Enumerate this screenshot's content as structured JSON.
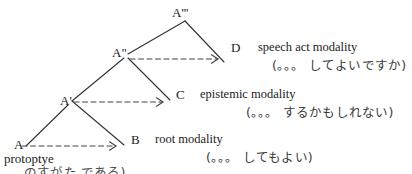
{
  "diagram": {
    "title_text": "",
    "colors": {
      "background": "#ffffff",
      "line": "#333333",
      "dashed_arrow": "#444444",
      "text": "#222222",
      "japanese_text": "#3a3a3a"
    },
    "nodes": [
      {
        "id": "A",
        "label": "A",
        "x": 14,
        "y": 138
      },
      {
        "id": "Ap",
        "label": "A'",
        "x": 60,
        "y": 94
      },
      {
        "id": "App",
        "label": "A\"",
        "x": 112,
        "y": 46
      },
      {
        "id": "Appp",
        "label": "A'''",
        "x": 172,
        "y": 6
      }
    ],
    "terminals": [
      {
        "id": "B",
        "label": "B",
        "gloss": "root modality",
        "japanese": "(。。。 してもよい)",
        "label_x": 131,
        "label_y": 133,
        "gloss_x": 155,
        "gloss_y": 133,
        "jp_x": 206,
        "jp_y": 152
      },
      {
        "id": "C",
        "label": "C",
        "gloss": "epistemic modality",
        "japanese": "(。。。 するかもしれない)",
        "label_x": 176,
        "label_y": 88,
        "gloss_x": 200,
        "gloss_y": 88,
        "jp_x": 246,
        "jp_y": 107
      },
      {
        "id": "D",
        "label": "D",
        "gloss": "speech act modality",
        "japanese": "(。。。 してよいですか)",
        "label_x": 231,
        "label_y": 41,
        "gloss_x": 258,
        "gloss_y": 41,
        "jp_x": 272,
        "jp_y": 60
      }
    ],
    "footer": {
      "prototype_label": "protoptye",
      "prototype_x": 4,
      "prototype_y": 152,
      "clipped_line": "のすがた   である)",
      "clipped_x": 24,
      "clipped_y": 167
    },
    "edges": {
      "spine": [
        {
          "from": "A",
          "to": "Ap",
          "x1": 26,
          "y1": 146,
          "x2": 68,
          "y2": 105
        },
        {
          "from": "Ap",
          "to": "App",
          "x1": 72,
          "y1": 101,
          "x2": 124,
          "y2": 58
        },
        {
          "from": "App",
          "to": "Appp",
          "x1": 128,
          "y1": 54,
          "x2": 185,
          "y2": 21
        }
      ],
      "branches": [
        {
          "from": "Ap",
          "to": "B",
          "x1": 72,
          "y1": 101,
          "x2": 124,
          "y2": 145
        },
        {
          "from": "App",
          "to": "C",
          "x1": 128,
          "y1": 58,
          "x2": 170,
          "y2": 100
        },
        {
          "from": "Appp",
          "to": "D",
          "x1": 185,
          "y1": 21,
          "x2": 224,
          "y2": 62
        }
      ],
      "arrows": [
        {
          "from": "A",
          "to": "B",
          "x1": 22,
          "y1": 146,
          "x2": 116,
          "y2": 146
        },
        {
          "from": "Ap",
          "to": "C",
          "x1": 74,
          "y1": 102,
          "x2": 163,
          "y2": 102
        },
        {
          "from": "App",
          "to": "D",
          "x1": 130,
          "y1": 59,
          "x2": 218,
          "y2": 59
        }
      ]
    }
  }
}
